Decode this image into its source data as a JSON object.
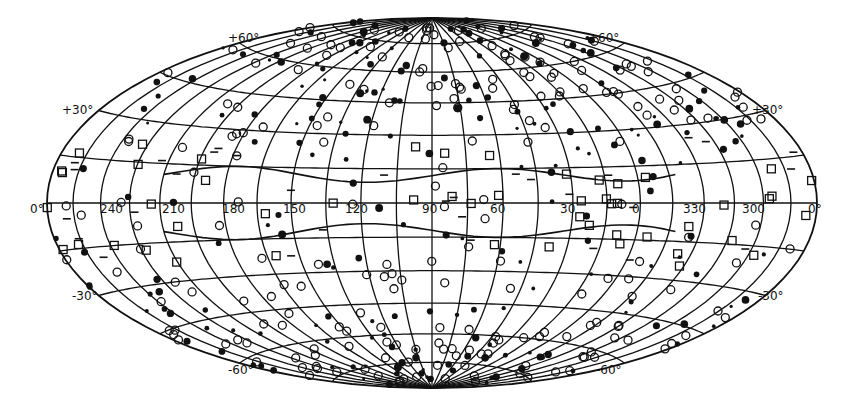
{
  "figure": {
    "projection": "aitoff-hammer-equal-area",
    "ink_color": "#111111",
    "background": "#ffffff",
    "longitude_labels": [
      "240",
      "210",
      "180",
      "150",
      "120",
      "90",
      "60",
      "30",
      "0",
      "330",
      "300"
    ],
    "equator_end_labels": {
      "left": "0°",
      "right": "0°"
    },
    "latitude_labels": {
      "upper_left_30": "+30°",
      "upper_right_30": "+30°",
      "upper_left_60": "+60°",
      "upper_right_60": "+60°",
      "lower_left_30": "-30°",
      "lower_right_30": "-30°",
      "lower_left_60": "-60°",
      "lower_right_60": "-60°"
    },
    "symbol_legend": [
      {
        "name": "filled-dot",
        "meaning": "plotted object"
      },
      {
        "name": "open-circle",
        "meaning": "plotted object"
      },
      {
        "name": "crossed-square",
        "meaning": "plotted object"
      },
      {
        "name": "dash",
        "meaning": "plotted object"
      }
    ]
  }
}
